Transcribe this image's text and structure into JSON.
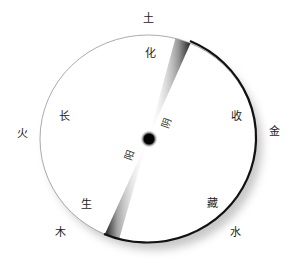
{
  "diagram": {
    "outer_labels": {
      "top": "土",
      "left": "火",
      "right": "金",
      "bottom_left": "木",
      "bottom_right": "水"
    },
    "inner_labels": {
      "top": "化",
      "left": "长",
      "right": "收",
      "bottom_left": "生",
      "bottom_right": "藏"
    },
    "center_labels": {
      "yin": "阴",
      "yang": "阳"
    },
    "colors": {
      "ink": "#000000",
      "paper": "#ffffff",
      "shadow": "#bbbbbb"
    }
  }
}
